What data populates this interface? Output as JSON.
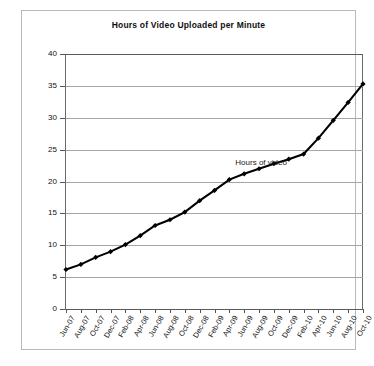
{
  "chart_data": {
    "type": "line",
    "title": "Hours of Video Uploaded per Minute",
    "xlabel": "",
    "ylabel": "",
    "ylim": [
      0,
      40
    ],
    "ytick_step": 5,
    "yticks": [
      0,
      5,
      10,
      15,
      20,
      25,
      30,
      35,
      40
    ],
    "grid": true,
    "legend_position": "inline-annotation",
    "annotation": "Hours of video",
    "series_name": "Hours of video",
    "line_color": "#000000",
    "marker": "diamond",
    "categories": [
      "Jun-07",
      "Aug-07",
      "Oct-07",
      "Dec-07",
      "Feb-08",
      "Apr-08",
      "Jun-08",
      "Aug-08",
      "Oct-08",
      "Dec-08",
      "Feb-09",
      "Apr-09",
      "Jun-09",
      "Aug-09",
      "Oct-09",
      "Dec-09",
      "Feb-10",
      "Apr-10",
      "Jun-10",
      "Aug-10",
      "Oct-10"
    ],
    "values": [
      6.2,
      7.0,
      8.1,
      9.0,
      10.1,
      11.5,
      13.1,
      14.0,
      15.2,
      17.0,
      18.6,
      20.3,
      21.2,
      22.0,
      22.8,
      23.5,
      24.3,
      26.8,
      29.6,
      32.4,
      35.3
    ]
  }
}
